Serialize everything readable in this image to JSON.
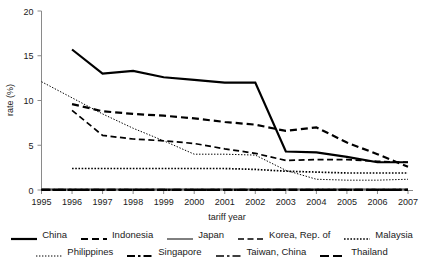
{
  "chart_data": {
    "type": "line",
    "title": "",
    "xlabel": "tariff year",
    "ylabel": "rate (%)",
    "xlim": [
      1995,
      2007
    ],
    "ylim": [
      0,
      20
    ],
    "yticks": [
      0,
      5,
      10,
      15,
      20
    ],
    "xticks": [
      1995,
      1996,
      1997,
      1998,
      1999,
      2000,
      2001,
      2002,
      2003,
      2004,
      2005,
      2006,
      2007
    ],
    "grid": false,
    "legend_position": "bottom",
    "x": [
      1995,
      1996,
      1997,
      1998,
      1999,
      2000,
      2001,
      2002,
      2003,
      2004,
      2005,
      2006,
      2007
    ],
    "series": [
      {
        "name": "China",
        "style": "solid-thick",
        "values": [
          null,
          15.7,
          13.0,
          13.3,
          12.6,
          12.3,
          12.0,
          12.0,
          4.3,
          4.2,
          3.7,
          3.1,
          3.1
        ]
      },
      {
        "name": "Indonesia",
        "style": "dashed-thick",
        "values": [
          null,
          9.6,
          8.8,
          8.5,
          8.3,
          8.0,
          7.6,
          7.3,
          6.6,
          7.0,
          5.3,
          4.0,
          2.6
        ]
      },
      {
        "name": "Japan",
        "style": "solid-thin",
        "values": [
          0.1,
          0.1,
          0.1,
          0.1,
          0.1,
          0.1,
          0.1,
          0.1,
          0.1,
          0.1,
          0.1,
          0.1,
          0.1
        ]
      },
      {
        "name": "Korea, Rep. of",
        "style": "dashed-medium",
        "values": [
          null,
          8.9,
          6.1,
          5.7,
          5.5,
          5.2,
          4.6,
          4.1,
          3.3,
          3.4,
          3.4,
          3.2,
          3.1
        ]
      },
      {
        "name": "Malaysia",
        "style": "dotted-thick",
        "values": [
          null,
          2.4,
          2.4,
          2.4,
          2.4,
          2.4,
          2.4,
          2.3,
          2.1,
          2.0,
          1.9,
          1.9,
          1.9
        ]
      },
      {
        "name": "Philippines",
        "style": "dotted-thin",
        "values": [
          12.1,
          10.3,
          8.5,
          6.9,
          5.5,
          4.0,
          4.0,
          3.9,
          2.2,
          1.2,
          1.1,
          1.1,
          1.2
        ]
      },
      {
        "name": "Singapore",
        "style": "dash-dot-thick",
        "values": [
          0.0,
          0.0,
          0.0,
          0.0,
          0.0,
          0.0,
          0.0,
          0.0,
          0.0,
          0.0,
          0.0,
          0.0,
          0.0
        ]
      },
      {
        "name": "Taiwan, China",
        "style": "dash-dot-thin",
        "values": [
          0.05,
          0.05,
          0.05,
          0.05,
          0.05,
          0.05,
          0.05,
          0.05,
          0.05,
          0.05,
          0.05,
          0.05,
          0.05
        ]
      },
      {
        "name": "Thailand",
        "style": "long-dash-thick",
        "values": [
          0.02,
          0.02,
          0.02,
          0.02,
          0.02,
          0.02,
          0.02,
          0.02,
          0.02,
          0.02,
          0.02,
          0.02,
          0.02
        ]
      }
    ]
  },
  "axes": {
    "ylabel": "rate (%)",
    "xlabel": "tariff year",
    "ytick_labels": [
      "0",
      "5",
      "10",
      "15",
      "20"
    ],
    "xtick_labels": [
      "1995",
      "1996",
      "1997",
      "1998",
      "1999",
      "2000",
      "2001",
      "2002",
      "2003",
      "2004",
      "2005",
      "2006",
      "2007"
    ]
  },
  "legend": {
    "row1": [
      {
        "label": "China",
        "style": "solid-thick"
      },
      {
        "label": "Indonesia",
        "style": "dashed-thick"
      },
      {
        "label": "Japan",
        "style": "solid-thin"
      },
      {
        "label": "Korea, Rep. of",
        "style": "dashed-medium"
      },
      {
        "label": "Malaysia",
        "style": "dotted-thick"
      }
    ],
    "row2": [
      {
        "label": "Philippines",
        "style": "dotted-thin"
      },
      {
        "label": "Singapore",
        "style": "dash-dot-thick"
      },
      {
        "label": "Taiwan, China",
        "style": "dash-dot-thin"
      },
      {
        "label": "Thailand",
        "style": "long-dash-thick"
      }
    ]
  },
  "colors": {
    "ink": "#000000",
    "axis": "#8a8a8a",
    "text": "#1a1a1a",
    "background": "#ffffff"
  }
}
